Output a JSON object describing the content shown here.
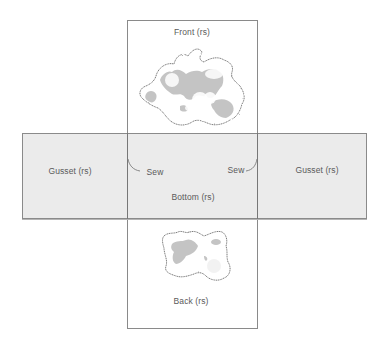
{
  "diagram": {
    "type": "sewing-pattern-layout",
    "pieces": {
      "front": {
        "label": "Front (rs)"
      },
      "back": {
        "label": "Back (rs)"
      },
      "bottom": {
        "label": "Bottom (rs)"
      },
      "gusset_left": {
        "label": "Gusset (rs)"
      },
      "gusset_right": {
        "label": "Gusset (rs)"
      }
    },
    "annotations": {
      "sew_left": "Sew",
      "sew_right": "Sew"
    },
    "colors": {
      "background": "#ffffff",
      "band_fill": "#ebebeb",
      "outline": "#8a8a8a",
      "motif_fill": "#c4c4c4",
      "text": "#5a5a5a"
    },
    "icons": {
      "front_motif": "floral-patch-motif",
      "back_motif": "floral-patch-motif"
    }
  }
}
